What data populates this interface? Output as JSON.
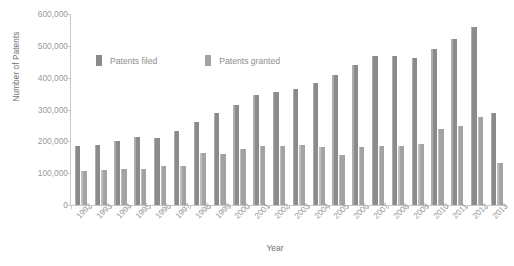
{
  "chart_data": {
    "type": "bar",
    "title": "",
    "xlabel": "Year",
    "ylabel": "Number of Patents",
    "ylim": [
      0,
      600000
    ],
    "ytick_values": [
      600000,
      500000,
      400000,
      300000,
      200000,
      100000,
      0
    ],
    "ytick_labels": [
      "600,000",
      "500,000",
      "400,000",
      "300,000",
      "200,000",
      "100,000",
      "0"
    ],
    "grid": false,
    "legend_position": "upper-left-inside",
    "categories": [
      "1992",
      "1993",
      "1994",
      "1995",
      "1996",
      "1997",
      "1998",
      "1999",
      "2000",
      "2001",
      "2002",
      "2003",
      "2004",
      "2005",
      "2006",
      "2007",
      "2008",
      "2009",
      "2010",
      "2011",
      "2012",
      "2013"
    ],
    "series": [
      {
        "name": "Patents filed",
        "color": "#8b8b8b",
        "values": [
          185000,
          188000,
          200000,
          213000,
          212000,
          233000,
          261000,
          289000,
          315000,
          346000,
          354000,
          363000,
          382000,
          409000,
          441000,
          467000,
          469000,
          463000,
          490000,
          520000,
          560000,
          288000
        ]
      },
      {
        "name": "Patents granted",
        "color": "#a3a3a3",
        "values": [
          107000,
          109000,
          113000,
          114000,
          122000,
          124000,
          163000,
          159000,
          176000,
          184000,
          185000,
          188000,
          181000,
          157000,
          183000,
          185000,
          186000,
          192000,
          238000,
          248000,
          277000,
          133000
        ]
      }
    ]
  },
  "legend": {
    "items": [
      {
        "label": "Patents filed",
        "color": "#8b8b8b"
      },
      {
        "label": "Patents granted",
        "color": "#a3a3a3"
      }
    ]
  }
}
